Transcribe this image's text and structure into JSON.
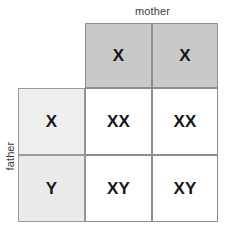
{
  "diagram": {
    "axis_labels": {
      "columns": "mother",
      "rows": "father"
    },
    "corner_cell": "",
    "column_headers": [
      "X",
      "X"
    ],
    "row_headers": [
      "X",
      "Y"
    ],
    "offspring": [
      [
        "XX",
        "XX"
      ],
      [
        "XY",
        "XY"
      ]
    ],
    "colors": {
      "column_header_fill": "#c9c9c9",
      "row_header_fill": "#efefef",
      "row_header_fill_alt": "#eaeaea",
      "body_fill": "#ffffff",
      "grid_line": "#8e8e8e",
      "text": "#17171a",
      "caption_text": "#3d3d3d",
      "background": "#ffffff"
    }
  }
}
